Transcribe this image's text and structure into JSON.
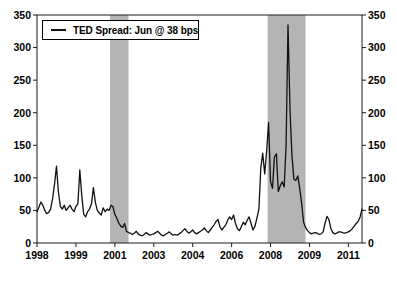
{
  "chart_data": {
    "type": "line",
    "title": "",
    "legend": "TED Spread: Jun @ 38 bps",
    "unit": "bps",
    "grid": false,
    "legend_position": "top-left",
    "ylim": [
      0,
      350
    ],
    "y_ticks": [
      0,
      50,
      100,
      150,
      200,
      250,
      300,
      350
    ],
    "y_axis_sides": "both",
    "x_start": "1998-01",
    "x_tick_interval_months": 20,
    "x_tick_labels": [
      "1998",
      "1999",
      "2001",
      "2003",
      "2004",
      "2006",
      "2008",
      "2009",
      "2011"
    ],
    "band_color": "#b4b4b4",
    "frame_color": "#1a1a1a",
    "recession_bands": [
      {
        "label": "2001 recession",
        "start_month": 37.5,
        "end_month": 47
      },
      {
        "label": "2007-2009 recession",
        "start_month": 118.5,
        "end_month": 138
      }
    ],
    "series": [
      {
        "name": "TED Spread",
        "color": "#111111",
        "start": "1998-01",
        "end": "2011-12",
        "monthly_values_bps": [
          48,
          55,
          63,
          58,
          50,
          45,
          47,
          52,
          68,
          90,
          118,
          78,
          56,
          52,
          58,
          50,
          54,
          58,
          52,
          48,
          56,
          60,
          112,
          72,
          44,
          40,
          48,
          52,
          60,
          85,
          62,
          50,
          46,
          43,
          54,
          48,
          52,
          50,
          58,
          56,
          44,
          38,
          31,
          26,
          24,
          30,
          18,
          16,
          15,
          13,
          15,
          18,
          14,
          12,
          11,
          13,
          16,
          14,
          12,
          13,
          14,
          16,
          18,
          15,
          12,
          11,
          13,
          15,
          17,
          14,
          12,
          13,
          12,
          14,
          16,
          19,
          22,
          18,
          15,
          17,
          20,
          16,
          14,
          16,
          18,
          20,
          23,
          19,
          16,
          20,
          24,
          28,
          33,
          36,
          25,
          20,
          24,
          28,
          35,
          40,
          36,
          43,
          30,
          22,
          19,
          25,
          32,
          28,
          35,
          40,
          30,
          20,
          26,
          38,
          52,
          115,
          138,
          106,
          140,
          185,
          95,
          84,
          132,
          137,
          79,
          88,
          94,
          86,
          150,
          335,
          205,
          135,
          98,
          96,
          103,
          84,
          60,
          32,
          24,
          19,
          16,
          14,
          15,
          16,
          15,
          13,
          14,
          17,
          30,
          41,
          36,
          22,
          16,
          14,
          15,
          17,
          17,
          16,
          15,
          16,
          17,
          19,
          22,
          26,
          30,
          33,
          40,
          52
        ]
      }
    ]
  }
}
